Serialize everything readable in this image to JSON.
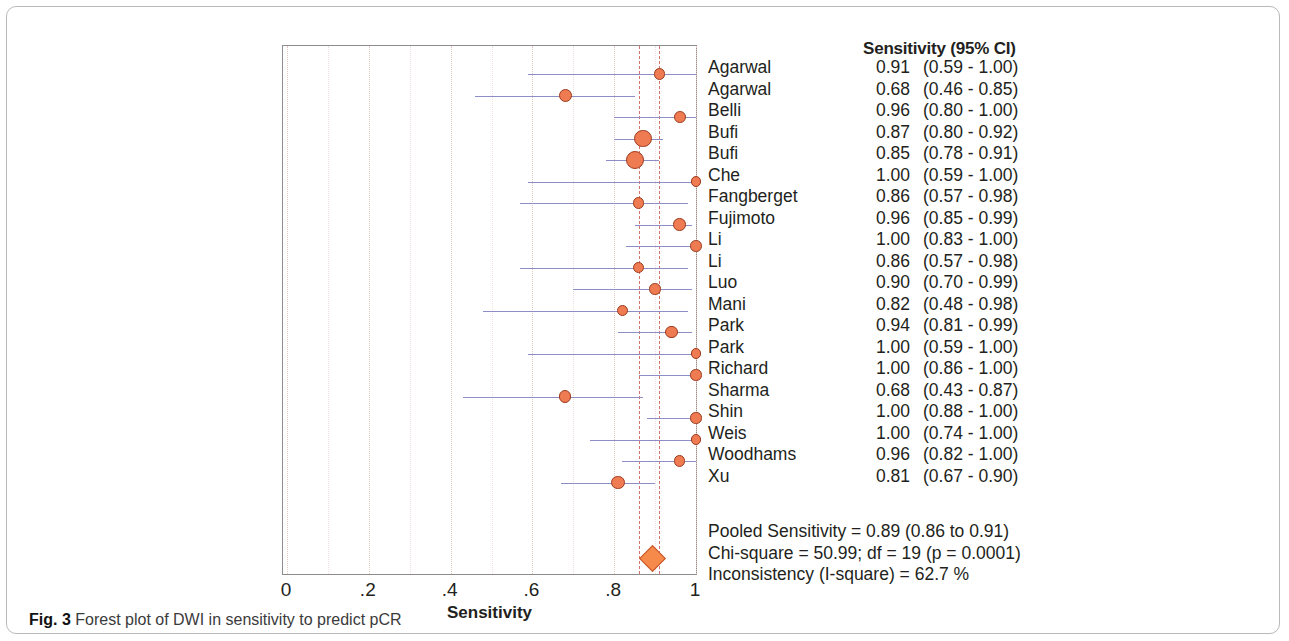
{
  "figure": {
    "caption_label": "Fig. 3",
    "caption_text": "Forest plot of DWI in sensitivity to predict pCR"
  },
  "table": {
    "column_header": "Sensitivity (95% CI)"
  },
  "axis": {
    "title": "Sensitivity",
    "ticks": [
      "0",
      ".2",
      ".4",
      ".6",
      ".8",
      "1"
    ]
  },
  "summary": {
    "pooled": "Pooled Sensitivity = 0.89 (0.86 to 0.91)",
    "chi_square": "Chi-square = 50.99; df =  19 (p = 0.0001)",
    "inconsistency": "Inconsistency (I-square) = 62.7 %"
  },
  "colors": {
    "marker_fill": "#ef7b52",
    "marker_stroke": "#9c3a1d",
    "ci_line": "#8e8ec6",
    "reference_line": "#d4756b",
    "diamond_fill": "#f58a4b",
    "frame": "#8c8c8c"
  },
  "chart_data": {
    "type": "forest",
    "title": "",
    "xlabel": "Sensitivity",
    "ylabel": "",
    "xlim": [
      0,
      1
    ],
    "xticks": [
      0,
      0.2,
      0.4,
      0.6,
      0.8,
      1
    ],
    "grid": true,
    "legend": "none",
    "effect_measure": "Sensitivity",
    "ci_level": "95%",
    "reference_lines": [
      0.86,
      0.91
    ],
    "pooled": {
      "label": "Pooled Sensitivity",
      "estimate": 0.89,
      "ci_low": 0.86,
      "ci_high": 0.91,
      "text": "Pooled Sensitivity = 0.89 (0.86 to 0.91)"
    },
    "heterogeneity": {
      "chi_square": 50.99,
      "df": 19,
      "p": 0.0001,
      "i_square_percent": 62.7
    },
    "studies": [
      {
        "name": "Agarwal",
        "estimate": 0.91,
        "ci_low": 0.59,
        "ci_high": 1.0,
        "est_text": "0.91",
        "ci_text": "(0.59 - 1.00)",
        "weight": 1.0
      },
      {
        "name": "Agarwal",
        "estimate": 0.68,
        "ci_low": 0.46,
        "ci_high": 0.85,
        "est_text": "0.68",
        "ci_text": "(0.46 - 0.85)",
        "weight": 1.6
      },
      {
        "name": "Belli",
        "estimate": 0.96,
        "ci_low": 0.8,
        "ci_high": 1.0,
        "est_text": "0.96",
        "ci_text": "(0.80 - 1.00)",
        "weight": 1.2
      },
      {
        "name": "Bufi",
        "estimate": 0.87,
        "ci_low": 0.8,
        "ci_high": 0.92,
        "est_text": "0.87",
        "ci_text": "(0.80 - 0.92)",
        "weight": 3.0
      },
      {
        "name": "Bufi",
        "estimate": 0.85,
        "ci_low": 0.78,
        "ci_high": 0.91,
        "est_text": "0.85",
        "ci_text": "(0.78 - 0.91)",
        "weight": 3.1
      },
      {
        "name": "Che",
        "estimate": 1.0,
        "ci_low": 0.59,
        "ci_high": 1.0,
        "est_text": "1.00",
        "ci_text": "(0.59 - 1.00)",
        "weight": 0.9
      },
      {
        "name": "Fangberget",
        "estimate": 0.86,
        "ci_low": 0.57,
        "ci_high": 0.98,
        "est_text": "0.86",
        "ci_text": "(0.57 - 0.98)",
        "weight": 1.0
      },
      {
        "name": "Fujimoto",
        "estimate": 0.96,
        "ci_low": 0.85,
        "ci_high": 0.99,
        "est_text": "0.96",
        "ci_text": "(0.85 - 0.99)",
        "weight": 1.4
      },
      {
        "name": "Li",
        "estimate": 1.0,
        "ci_low": 0.83,
        "ci_high": 1.0,
        "est_text": "1.00",
        "ci_text": "(0.83 - 1.00)",
        "weight": 1.1
      },
      {
        "name": "Li",
        "estimate": 0.86,
        "ci_low": 0.57,
        "ci_high": 0.98,
        "est_text": "0.86",
        "ci_text": "(0.57 - 0.98)",
        "weight": 1.0
      },
      {
        "name": "Luo",
        "estimate": 0.9,
        "ci_low": 0.7,
        "ci_high": 0.99,
        "est_text": "0.90",
        "ci_text": "(0.70 - 0.99)",
        "weight": 1.1
      },
      {
        "name": "Mani",
        "estimate": 0.82,
        "ci_low": 0.48,
        "ci_high": 0.98,
        "est_text": "0.82",
        "ci_text": "(0.48 - 0.98)",
        "weight": 1.0
      },
      {
        "name": "Park",
        "estimate": 0.94,
        "ci_low": 0.81,
        "ci_high": 0.99,
        "est_text": "0.94",
        "ci_text": "(0.81 - 0.99)",
        "weight": 1.3
      },
      {
        "name": "Park",
        "estimate": 1.0,
        "ci_low": 0.59,
        "ci_high": 1.0,
        "est_text": "1.00",
        "ci_text": "(0.59 - 1.00)",
        "weight": 0.9
      },
      {
        "name": "Richard",
        "estimate": 1.0,
        "ci_low": 0.86,
        "ci_high": 1.0,
        "est_text": "1.00",
        "ci_text": "(0.86 - 1.00)",
        "weight": 1.0
      },
      {
        "name": "Sharma",
        "estimate": 0.68,
        "ci_low": 0.43,
        "ci_high": 0.87,
        "est_text": "0.68",
        "ci_text": "(0.43 - 0.87)",
        "weight": 1.4
      },
      {
        "name": "Shin",
        "estimate": 1.0,
        "ci_low": 0.88,
        "ci_high": 1.0,
        "est_text": "1.00",
        "ci_text": "(0.88 - 1.00)",
        "weight": 1.0
      },
      {
        "name": "Weis",
        "estimate": 1.0,
        "ci_low": 0.74,
        "ci_high": 1.0,
        "est_text": "1.00",
        "ci_text": "(0.74 - 1.00)",
        "weight": 0.9
      },
      {
        "name": "Woodhams",
        "estimate": 0.96,
        "ci_low": 0.82,
        "ci_high": 1.0,
        "est_text": "0.96",
        "ci_text": "(0.82 - 1.00)",
        "weight": 1.1
      },
      {
        "name": "Xu",
        "estimate": 0.81,
        "ci_low": 0.67,
        "ci_high": 0.9,
        "est_text": "0.81",
        "ci_text": "(0.67 - 0.90)",
        "weight": 1.8
      }
    ]
  }
}
